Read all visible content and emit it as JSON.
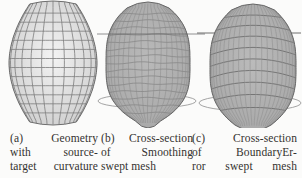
{
  "figure": {
    "background": "#fbfbfa",
    "text_color": "#34322f"
  },
  "panels": [
    {
      "label": "(a)",
      "caption": "Geometry with source-target curvature",
      "caption_lines": [
        "(a) Geometry",
        "with source-",
        "target curvature"
      ],
      "mesh_kind": "barrel-quad-mesh",
      "overlays": [],
      "colors": {
        "fill_center": "#f3f3f3",
        "fill_edge": "#cccccc",
        "lon": "#7c7c7c",
        "lat": "#7c7c7c",
        "outline": "#6e6e6e"
      }
    },
    {
      "label": "(b)",
      "caption": "Cross-section of Smoothing swept mesh",
      "caption_lines": [
        "(b) Cross-section",
        "of Smoothing",
        "swept mesh"
      ],
      "mesh_kind": "capsule-quad-mesh",
      "overlays": [
        "section-line",
        "section-ellipse"
      ],
      "colors": {
        "fill_center": "#b9b9b9",
        "fill_edge": "#a7a7a7",
        "lon": "#8d8d8d",
        "lat": "#7b7b7b",
        "outline": "#676767",
        "section_line": "#5f5f5f",
        "section_ellipse": "#9a9a9a"
      }
    },
    {
      "label": "(c)",
      "caption": "Cross-section of BoundaryError swept mesh",
      "caption_lines": [
        "(c) Cross-section",
        "of BoundaryEr-",
        "ror swept mesh"
      ],
      "mesh_kind": "capsule-quad-mesh",
      "overlays": [
        "section-line",
        "section-ellipse"
      ],
      "colors": {
        "fill_center": "#bbbbbb",
        "fill_edge": "#a6a6a6",
        "lon": "#909090",
        "lat": "#6e6e6e",
        "outline": "#676767",
        "section_line": "#5f5f5f",
        "section_ellipse": "#9a9a9a"
      }
    }
  ]
}
